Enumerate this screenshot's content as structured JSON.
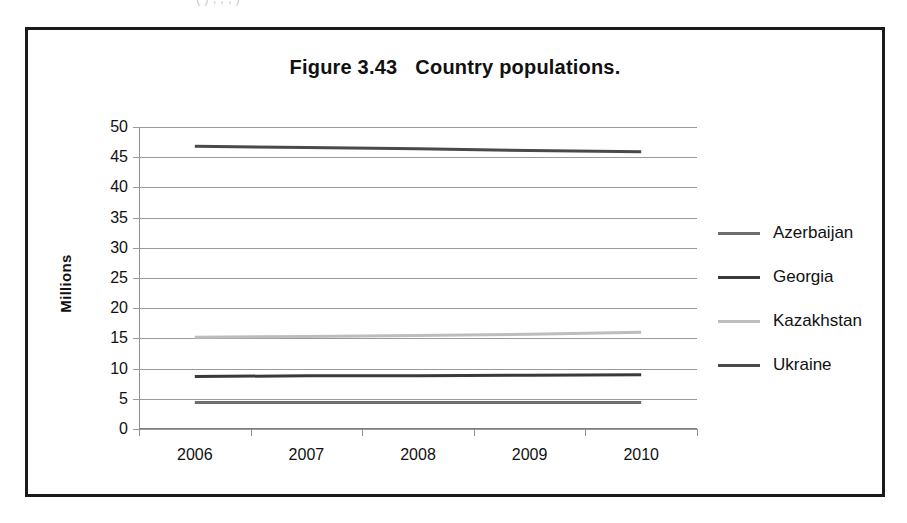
{
  "page": {
    "top_sliver_text": "(  )  ,  ,  ,  )"
  },
  "figure": {
    "label": "Figure 3.43",
    "title": "Country populations."
  },
  "chart_data": {
    "type": "line",
    "xlabel": "",
    "ylabel": "Millions",
    "x": [
      "2006",
      "2007",
      "2008",
      "2009",
      "2010"
    ],
    "ylim": [
      0,
      50
    ],
    "ytick_step": 5,
    "yticks": [
      "50",
      "45",
      "40",
      "35",
      "30",
      "25",
      "20",
      "15",
      "10",
      "5",
      "0"
    ],
    "grid": true,
    "legend_position": "right",
    "series": [
      {
        "name": "Azerbaijan",
        "color": "#6e6e6e",
        "values": [
          4.4,
          4.4,
          4.4,
          4.4,
          4.4
        ]
      },
      {
        "name": "Georgia",
        "color": "#3a3a3a",
        "values": [
          8.7,
          8.8,
          8.8,
          8.9,
          9.0
        ]
      },
      {
        "name": "Kazakhstan",
        "color": "#bdbdbd",
        "values": [
          15.2,
          15.3,
          15.5,
          15.7,
          16.0
        ]
      },
      {
        "name": "Ukraine",
        "color": "#4a4a4a",
        "values": [
          46.8,
          46.6,
          46.4,
          46.1,
          45.9
        ]
      }
    ]
  }
}
